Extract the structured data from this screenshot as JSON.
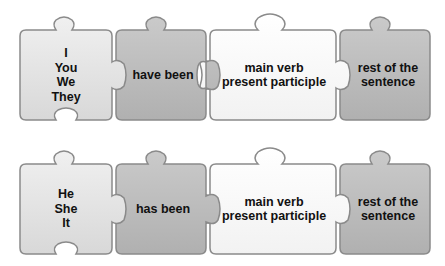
{
  "colors": {
    "light_piece": "#e4e4e4",
    "dark_piece": "#bdbdbd",
    "white_piece": "#fafafa",
    "outline": "#8a8a8a",
    "text": "#111111"
  },
  "rows": [
    {
      "pieces": [
        {
          "kind": "subject",
          "lines": [
            "I",
            "You",
            "We",
            "They"
          ]
        },
        {
          "kind": "auxiliary",
          "lines": [
            "have been"
          ]
        },
        {
          "kind": "main-verb",
          "lines": [
            "main verb",
            "present participle"
          ]
        },
        {
          "kind": "rest",
          "lines": [
            "rest of the",
            "sentence"
          ]
        }
      ]
    },
    {
      "pieces": [
        {
          "kind": "subject",
          "lines": [
            "He",
            "She",
            "It"
          ]
        },
        {
          "kind": "auxiliary",
          "lines": [
            "has been"
          ]
        },
        {
          "kind": "main-verb",
          "lines": [
            "main verb",
            "present participle"
          ]
        },
        {
          "kind": "rest",
          "lines": [
            "rest of the",
            "sentence"
          ]
        }
      ]
    }
  ]
}
